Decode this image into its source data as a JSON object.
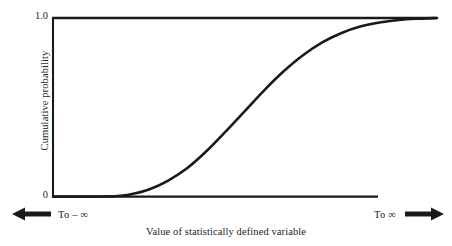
{
  "figure": {
    "background_color": "#ffffff",
    "line_color": "#1a1a1a"
  },
  "axes": {
    "y_label": "Cumulative probability",
    "x_label": "Value of statistically defined variable",
    "y_tick_top": "1.0",
    "y_tick_bottom": "0"
  },
  "annotations": {
    "left_arrow_icon": "left-arrow-icon",
    "left_text": "To – ∞",
    "right_text": "To ∞",
    "right_arrow_icon": "right-arrow-icon"
  },
  "chart_data": {
    "type": "line",
    "title": "",
    "subtitle": "",
    "xlabel": "Value of statistically defined variable",
    "ylabel": "Cumulative probability",
    "xlim": [
      0,
      1
    ],
    "ylim": [
      0,
      1
    ],
    "xticks": [],
    "xticklabels": [],
    "yticks": [
      0,
      1
    ],
    "yticklabels": [
      "0",
      "1.0"
    ],
    "grid": false,
    "legend": false,
    "legend_position": "none",
    "annotations": [
      "To – ∞",
      "To ∞"
    ],
    "series": [
      {
        "name": "Cumulative probability (ogive)",
        "x": [
          0.0,
          0.05,
          0.1,
          0.15,
          0.16,
          0.2,
          0.25,
          0.3,
          0.35,
          0.4,
          0.45,
          0.5,
          0.55,
          0.6,
          0.65,
          0.7,
          0.75,
          0.8,
          0.85,
          0.9,
          0.95,
          1.0
        ],
        "y": [
          0.0,
          0.0,
          0.0,
          0.001,
          0.002,
          0.012,
          0.04,
          0.09,
          0.16,
          0.255,
          0.365,
          0.48,
          0.595,
          0.7,
          0.79,
          0.862,
          0.915,
          0.952,
          0.975,
          0.989,
          0.996,
          1.0
        ]
      }
    ]
  }
}
